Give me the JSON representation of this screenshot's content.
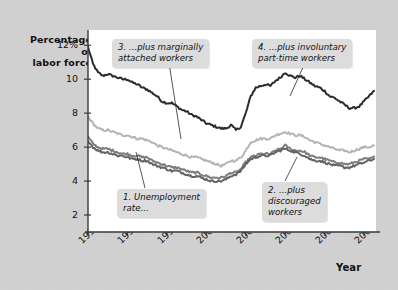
{
  "chart_data": {
    "type": "line",
    "title": "",
    "xlabel": "Year",
    "ylabel": "Percentage of labor force",
    "xlim": [
      1994,
      2008.6
    ],
    "ylim": [
      1.0,
      12.9
    ],
    "grid": false,
    "legend_position": "inline-callouts",
    "xticks": [
      "1994",
      "1996",
      "1998",
      "2000",
      "2002",
      "2004",
      "2006",
      "2008"
    ],
    "xtick_values": [
      1994,
      1996,
      1998,
      2000,
      2002,
      2004,
      2006,
      2008
    ],
    "yticks": [
      "12%",
      "10",
      "8",
      "6",
      "4",
      "2"
    ],
    "ytick_values": [
      12,
      10,
      8,
      6,
      4,
      2
    ],
    "x": [
      1994.0,
      1994.25,
      1994.5,
      1994.75,
      1995.0,
      1995.25,
      1995.5,
      1995.75,
      1996.0,
      1996.25,
      1996.5,
      1996.75,
      1997.0,
      1997.25,
      1997.5,
      1997.75,
      1998.0,
      1998.25,
      1998.5,
      1998.75,
      1999.0,
      1999.25,
      1999.5,
      1999.75,
      2000.0,
      2000.25,
      2000.5,
      2000.75,
      2001.0,
      2001.25,
      2001.5,
      2001.75,
      2002.0,
      2002.25,
      2002.5,
      2002.75,
      2003.0,
      2003.25,
      2003.5,
      2003.75,
      2004.0,
      2004.25,
      2004.5,
      2004.75,
      2005.0,
      2005.25,
      2005.5,
      2005.75,
      2006.0,
      2006.25,
      2006.5,
      2006.75,
      2007.0,
      2007.25,
      2007.5,
      2007.75,
      2008.0,
      2008.25,
      2008.5
    ],
    "series": [
      {
        "name": "4. ...plus involuntary part-time workers",
        "color": "#2b2b2b",
        "values": [
          11.9,
          10.9,
          10.4,
          10.2,
          10.3,
          10.2,
          10.1,
          10.0,
          10.0,
          9.8,
          9.7,
          9.5,
          9.4,
          9.2,
          9.0,
          8.7,
          8.6,
          8.6,
          8.4,
          8.2,
          8.1,
          7.9,
          7.8,
          7.6,
          7.4,
          7.3,
          7.2,
          7.1,
          7.1,
          7.3,
          7.0,
          7.2,
          8.0,
          9.0,
          9.5,
          9.6,
          9.7,
          9.6,
          9.9,
          10.1,
          10.4,
          10.2,
          10.1,
          10.2,
          10.0,
          9.8,
          9.6,
          9.5,
          9.3,
          9.0,
          8.9,
          8.7,
          8.5,
          8.3,
          8.3,
          8.4,
          8.7,
          9.0,
          9.3
        ]
      },
      {
        "name": "3. ...plus marginally attached workers",
        "color": "#b4b4b4",
        "values": [
          7.8,
          7.4,
          7.1,
          7.0,
          7.0,
          6.9,
          6.8,
          6.7,
          6.7,
          6.6,
          6.5,
          6.5,
          6.4,
          6.3,
          6.1,
          6.0,
          5.9,
          5.8,
          5.7,
          5.6,
          5.5,
          5.4,
          5.4,
          5.3,
          5.2,
          5.1,
          5.0,
          4.9,
          5.0,
          5.2,
          5.2,
          5.4,
          5.8,
          6.3,
          6.4,
          6.5,
          6.5,
          6.5,
          6.7,
          6.8,
          6.9,
          6.8,
          6.7,
          6.7,
          6.6,
          6.4,
          6.3,
          6.2,
          6.1,
          6.0,
          5.9,
          5.8,
          5.8,
          5.7,
          5.8,
          5.9,
          6.0,
          6.0,
          6.1
        ]
      },
      {
        "name": "2. ...plus discouraged workers",
        "color": "#7d7d7d",
        "values": [
          6.6,
          6.2,
          6.0,
          5.9,
          5.9,
          5.8,
          5.7,
          5.6,
          5.6,
          5.5,
          5.5,
          5.4,
          5.4,
          5.2,
          5.1,
          5.0,
          4.9,
          4.8,
          4.8,
          4.7,
          4.6,
          4.5,
          4.5,
          4.4,
          4.3,
          4.2,
          4.2,
          4.2,
          4.3,
          4.5,
          4.5,
          4.7,
          5.1,
          5.4,
          5.5,
          5.6,
          5.6,
          5.6,
          5.8,
          5.9,
          6.1,
          5.9,
          5.8,
          5.8,
          5.7,
          5.5,
          5.4,
          5.4,
          5.3,
          5.2,
          5.1,
          5.1,
          5.0,
          5.0,
          5.1,
          5.2,
          5.3,
          5.3,
          5.4
        ]
      },
      {
        "name": "1. Unemployment rate...",
        "color": "#636363",
        "values": [
          6.4,
          6.0,
          5.8,
          5.7,
          5.7,
          5.6,
          5.5,
          5.5,
          5.4,
          5.3,
          5.3,
          5.2,
          5.2,
          5.0,
          4.9,
          4.8,
          4.7,
          4.6,
          4.6,
          4.5,
          4.4,
          4.3,
          4.3,
          4.2,
          4.1,
          4.0,
          4.0,
          4.0,
          4.1,
          4.3,
          4.4,
          4.6,
          5.0,
          5.3,
          5.4,
          5.5,
          5.5,
          5.5,
          5.7,
          5.8,
          5.9,
          5.8,
          5.7,
          5.6,
          5.5,
          5.3,
          5.2,
          5.2,
          5.1,
          5.0,
          4.9,
          4.9,
          4.8,
          4.8,
          4.9,
          5.0,
          5.1,
          5.2,
          5.3
        ]
      }
    ],
    "annotations": [
      {
        "id": "callout-1",
        "text": "1. Unemployment\nrate..."
      },
      {
        "id": "callout-2",
        "text": "2. ...plus\ndiscouraged\nworkers"
      },
      {
        "id": "callout-3",
        "text": "3. ...plus marginally\nattached workers"
      },
      {
        "id": "callout-4",
        "text": "4. ...plus involuntary\npart-time workers"
      }
    ]
  },
  "axes": {
    "y_title_line1": "Percentage of",
    "y_title_line2": "labor force",
    "x_title": "Year"
  }
}
